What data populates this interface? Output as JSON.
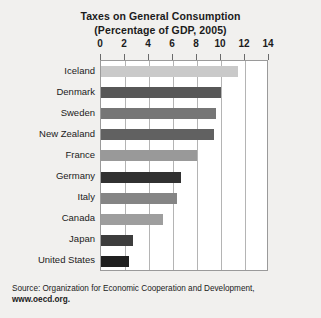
{
  "chart_data": {
    "type": "bar",
    "orientation": "horizontal",
    "title": "Taxes on General Consumption",
    "subtitle": "(Percentage of GDP, 2005)",
    "xlabel": "",
    "ylabel": "",
    "xlim": [
      0,
      14
    ],
    "xticks": [
      0,
      2,
      4,
      6,
      8,
      10,
      12,
      14
    ],
    "xticklabels": [
      "0",
      "2",
      "4",
      "6",
      "8",
      "10",
      "12",
      "14"
    ],
    "grid": true,
    "grid_axis": "x",
    "legend": false,
    "categories": [
      "Iceland",
      "Denmark",
      "Sweden",
      "New Zealand",
      "France",
      "Germany",
      "Italy",
      "Canada",
      "Japan",
      "United States"
    ],
    "values": [
      11.4,
      10.0,
      9.6,
      9.4,
      8.0,
      6.7,
      6.3,
      5.2,
      2.7,
      2.3
    ],
    "bar_colors": [
      "#c9c9c9",
      "#575757",
      "#767676",
      "#616161",
      "#999999",
      "#313131",
      "#858585",
      "#9e9e9e",
      "#3d3d3d",
      "#1f1f1f"
    ]
  },
  "source": {
    "line1": "Source: Organization for Economic Cooperation and Development,",
    "line2": "www.oecd.org."
  },
  "colors": {
    "figure_background": "#f1f0ee",
    "plot_background": "#ffffff",
    "plot_border": "#9a9a9a",
    "gridline": "#b4b4b4",
    "text": "#1b1b1b"
  }
}
